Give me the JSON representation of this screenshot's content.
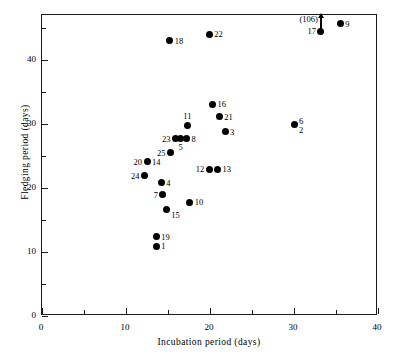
{
  "chart_data": {
    "type": "scatter",
    "title": "",
    "xlabel": "Incubation period (days)",
    "ylabel": "Fledging period (days)",
    "xlim": [
      0,
      40
    ],
    "ylim": [
      0,
      47
    ],
    "grid": false,
    "legend": "none",
    "x_major_ticks": [
      0,
      10,
      20,
      30,
      40
    ],
    "x_minor_ticks": [
      5,
      15,
      25,
      35
    ],
    "y_major_ticks": [
      0,
      10,
      20,
      30,
      40
    ],
    "y_minor_ticks": [
      5,
      15,
      25,
      35,
      45
    ],
    "x_tick_labels": [
      "0",
      "10",
      "20",
      "30",
      "40"
    ],
    "y_tick_labels": [
      "0",
      "10",
      "20",
      "30",
      "40"
    ],
    "point_labels_note": "Each marker is annotated with its species index number; markers 20/14, 6/2 and (106)/17 share a single plotted marker.",
    "annotations": [
      {
        "text": "(106)",
        "x": 33,
        "y": 45.6,
        "kind": "off-scale-arrow",
        "refers_to": "17",
        "description": "Upward arrow from point 17 indicating its true fledging period is 106 days, off the plotted scale."
      }
    ],
    "points": [
      {
        "label": "1",
        "x": 13.6,
        "y": 10.9,
        "lx": "right"
      },
      {
        "label": "19",
        "x": 13.6,
        "y": 12.4,
        "lx": "right"
      },
      {
        "label": "15",
        "x": 14.8,
        "y": 16.6,
        "lx": "right-below"
      },
      {
        "label": "7",
        "x": 14.4,
        "y": 18.9,
        "lx": "left"
      },
      {
        "label": "10",
        "x": 17.6,
        "y": 17.8,
        "lx": "right"
      },
      {
        "label": "4",
        "x": 14.2,
        "y": 20.8,
        "lx": "right"
      },
      {
        "label": "24",
        "x": 12.2,
        "y": 21.9,
        "lx": "left"
      },
      {
        "label": "20",
        "x": 12.5,
        "y": 24.1,
        "lx": "left"
      },
      {
        "label": "14",
        "x": 12.5,
        "y": 24.1,
        "lx": "right"
      },
      {
        "label": "12",
        "x": 19.9,
        "y": 22.9,
        "lx": "left"
      },
      {
        "label": "13",
        "x": 20.9,
        "y": 22.9,
        "lx": "right"
      },
      {
        "label": "25",
        "x": 15.3,
        "y": 25.5,
        "lx": "left"
      },
      {
        "label": "23",
        "x": 15.9,
        "y": 27.7,
        "lx": "left"
      },
      {
        "label": "5",
        "x": 16.5,
        "y": 27.7,
        "lx": "below"
      },
      {
        "label": "8",
        "x": 17.2,
        "y": 27.7,
        "lx": "right"
      },
      {
        "label": "11",
        "x": 17.3,
        "y": 29.8,
        "lx": "above"
      },
      {
        "label": "3",
        "x": 21.8,
        "y": 28.8,
        "lx": "right"
      },
      {
        "label": "21",
        "x": 21.1,
        "y": 31.1,
        "lx": "right"
      },
      {
        "label": "16",
        "x": 20.3,
        "y": 33.1,
        "lx": "right"
      },
      {
        "label": "6",
        "x": 30.0,
        "y": 29.9,
        "lx": "right-above"
      },
      {
        "label": "2",
        "x": 30.0,
        "y": 29.9,
        "lx": "right-below"
      },
      {
        "label": "18",
        "x": 15.2,
        "y": 43.0,
        "lx": "right"
      },
      {
        "label": "22",
        "x": 19.9,
        "y": 44.0,
        "lx": "right"
      },
      {
        "label": "17",
        "x": 33.2,
        "y": 44.5,
        "lx": "left"
      },
      {
        "label": "9",
        "x": 35.5,
        "y": 45.6,
        "lx": "right"
      }
    ]
  }
}
